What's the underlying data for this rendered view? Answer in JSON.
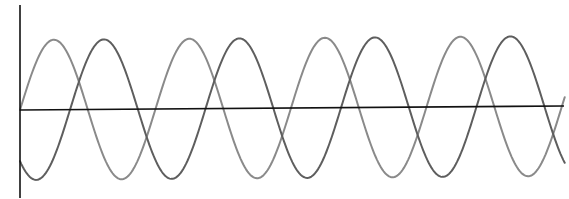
{
  "chart_data": {
    "type": "line",
    "title": "",
    "xlabel": "",
    "ylabel": "",
    "grid": false,
    "legend": null,
    "xlim": [
      0,
      4.02
    ],
    "ylim": [
      -1,
      1
    ],
    "x_units": "periods",
    "series": [
      {
        "name": "wave-a",
        "color": "#8a8a8a",
        "amplitude": 1,
        "phase_deg": 0,
        "x": [
          0,
          0.25,
          0.5,
          0.75,
          1.0,
          1.25,
          1.5,
          1.75,
          2.0,
          2.25,
          2.5,
          2.75,
          3.0,
          3.25,
          3.5,
          3.75,
          4.0
        ],
        "values": [
          0,
          1,
          0,
          -1,
          0,
          1,
          0,
          -1,
          0,
          1,
          0,
          -1,
          0,
          1,
          0,
          -1,
          0
        ]
      },
      {
        "name": "wave-b",
        "color": "#5e5e5e",
        "amplitude": 1,
        "phase_deg": -133,
        "x": [
          0,
          0.25,
          0.5,
          0.75,
          1.0,
          1.25,
          1.5,
          1.75,
          2.0,
          2.25,
          2.5,
          2.75,
          3.0,
          3.25,
          3.5,
          3.75,
          4.0
        ],
        "values": [
          -0.73,
          0.68,
          0.73,
          -0.68,
          -0.73,
          0.68,
          0.73,
          -0.68,
          -0.73,
          0.68,
          0.73,
          -0.68,
          -0.73,
          0.68,
          0.73,
          -0.68,
          -0.73
        ]
      }
    ]
  },
  "layout": {
    "origin_x": 20,
    "x_end": 564,
    "axis_y_left": 110,
    "axis_y_right": 106,
    "y_axis_top": 5,
    "y_axis_bottom": 198,
    "amplitude_px": 70,
    "period_px": 135.5
  }
}
